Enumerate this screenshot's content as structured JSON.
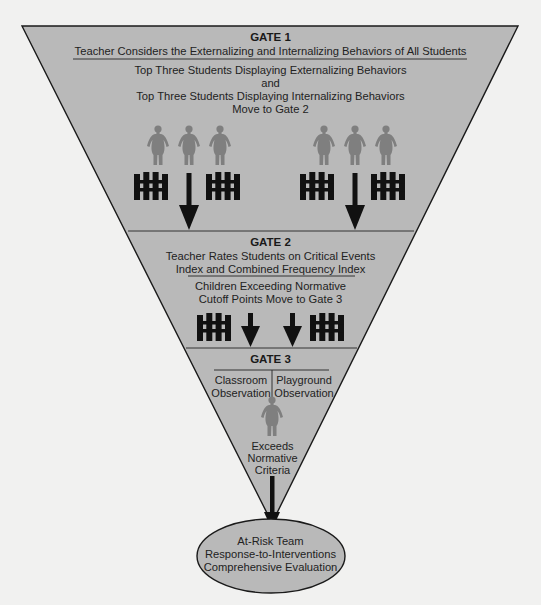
{
  "colors": {
    "background": "#f1f1f0",
    "funnel_fill": "#b9b9b9",
    "outline": "#1a1a1a",
    "person": "#7f7f7f",
    "fence": "#111111",
    "ellipse_fill": "#b9b9b9"
  },
  "gate1": {
    "title": "GATE 1",
    "subtitle": "Teacher Considers the Externalizing and Internalizing Behaviors of All Students",
    "lines": [
      "Top Three Students Displaying Externalizing Behaviors",
      "and",
      "Top Three Students Displaying Internalizing Behaviors",
      "Move to Gate 2"
    ],
    "groups": [
      {
        "name": "externalizing-group",
        "people": 3,
        "icons": [
          "fence-icon",
          "arrow-down-icon",
          "fence-icon"
        ]
      },
      {
        "name": "internalizing-group",
        "people": 3,
        "icons": [
          "fence-icon",
          "arrow-down-icon",
          "fence-icon"
        ]
      }
    ]
  },
  "gate2": {
    "title": "GATE 2",
    "subtitle_lines": [
      "Teacher Rates Students on Critical Events",
      "Index and Combined Frequency Index"
    ],
    "lines": [
      "Children Exceeding Normative",
      "Cutoff Points Move to Gate 3"
    ],
    "icons": [
      "fence-icon",
      "arrow-down-icon",
      "arrow-down-icon",
      "fence-icon"
    ]
  },
  "gate3": {
    "title": "GATE 3",
    "left_col": [
      "Classroom",
      "Observation"
    ],
    "right_col": [
      "Playground",
      "Observation"
    ],
    "criteria_lines": [
      "Exceeds",
      "Normative",
      "Criteria"
    ]
  },
  "outcome": {
    "lines": [
      "At-Risk Team",
      "Response-to-Interventions",
      "Comprehensive Evaluation"
    ]
  }
}
